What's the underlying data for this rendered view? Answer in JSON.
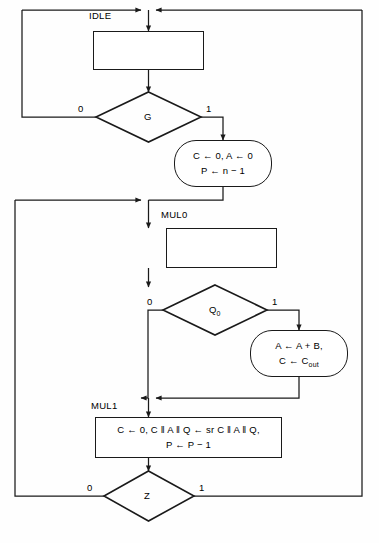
{
  "diagram": {
    "type": "asm-chart",
    "colors": {
      "line": "#1a1a1a",
      "background": "#fefefe",
      "text": "#000000"
    },
    "states": [
      {
        "id": "idle",
        "name": "IDLE",
        "shape": "rectangle",
        "body": ""
      },
      {
        "id": "mul0",
        "name": "MUL0",
        "shape": "rectangle",
        "body": ""
      },
      {
        "id": "mul1",
        "name": "MUL1",
        "shape": "rectangle",
        "body_line1": "C ← 0, C ‖ A ‖ Q ← sr C ‖ A ‖ Q,",
        "body_line2": "P ← P − 1"
      }
    ],
    "decisions": [
      {
        "id": "g",
        "label": "G",
        "label_sub": "",
        "branch_left": "0",
        "branch_right": "1"
      },
      {
        "id": "q0",
        "label": "Q",
        "label_sub": "0",
        "branch_left": "0",
        "branch_right": "1"
      },
      {
        "id": "z",
        "label": "Z",
        "label_sub": "",
        "branch_left": "0",
        "branch_right": "1"
      }
    ],
    "conditional_outputs": [
      {
        "id": "init",
        "line1": "C ← 0, A ← 0",
        "line2": "P ← n − 1"
      },
      {
        "id": "add",
        "line1": "A ← A + B,",
        "line2_prefix": "C ← C",
        "line2_sub": "out"
      }
    ]
  }
}
